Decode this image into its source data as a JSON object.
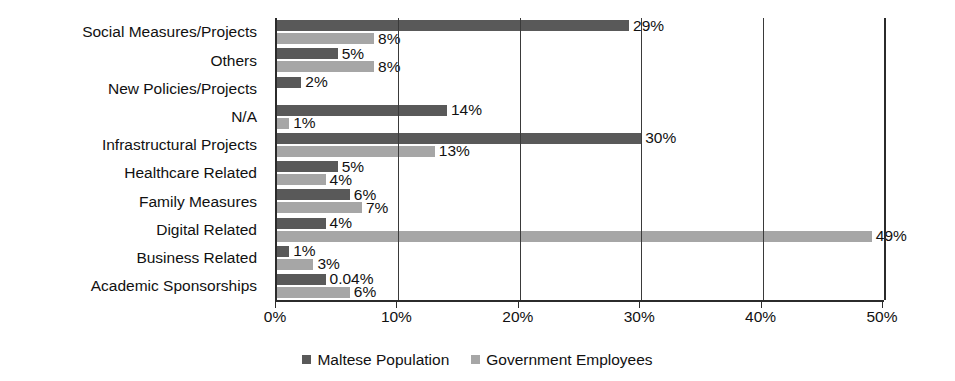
{
  "chart_data": {
    "type": "bar",
    "orientation": "horizontal",
    "title": "",
    "xlabel": "",
    "ylabel": "",
    "xlim": [
      0,
      50
    ],
    "xtick_labels": [
      "0%",
      "10%",
      "20%",
      "30%",
      "40%",
      "50%"
    ],
    "xtick_values": [
      0,
      10,
      20,
      30,
      40,
      50
    ],
    "grid": "vertical",
    "legend_position": "bottom",
    "categories": [
      "Social Measures/Projects",
      "Others",
      "New Policies/Projects",
      "N/A",
      "Infrastructural Projects",
      "Healthcare Related",
      "Family Measures",
      "Digital Related",
      "Business Related",
      "Academic Sponsorships"
    ],
    "series": [
      {
        "name": "Maltese Population",
        "color": "#595959",
        "values": [
          29,
          5,
          2,
          14,
          30,
          5,
          6,
          4,
          1,
          0.04
        ],
        "labels": [
          "29%",
          "5%",
          "2%",
          "14%",
          "30%",
          "5%",
          "6%",
          "4%",
          "1%",
          "0.04%"
        ],
        "bar_lengths_percent": [
          29,
          5,
          2,
          14,
          30,
          5,
          6,
          4,
          1,
          4
        ]
      },
      {
        "name": "Government Employees",
        "color": "#a6a6a6",
        "values": [
          8,
          8,
          null,
          1,
          13,
          4,
          7,
          49,
          3,
          6
        ],
        "labels": [
          "8%",
          "8%",
          "",
          "1%",
          "13%",
          "4%",
          "7%",
          "49%",
          "3%",
          "6%"
        ],
        "bar_lengths_percent": [
          8,
          8,
          0,
          1,
          13,
          4,
          7,
          49,
          3,
          6
        ]
      }
    ]
  },
  "legend": {
    "items": [
      {
        "label": "Maltese Population",
        "swatch": "dark-square-icon"
      },
      {
        "label": "Government Employees",
        "swatch": "light-square-icon"
      }
    ]
  },
  "colors": {
    "series_dark": "#595959",
    "series_light": "#a6a6a6",
    "axis": "#2b2b2b",
    "gridline": "#3a3a3a",
    "text": "#111111",
    "background": "#ffffff"
  }
}
